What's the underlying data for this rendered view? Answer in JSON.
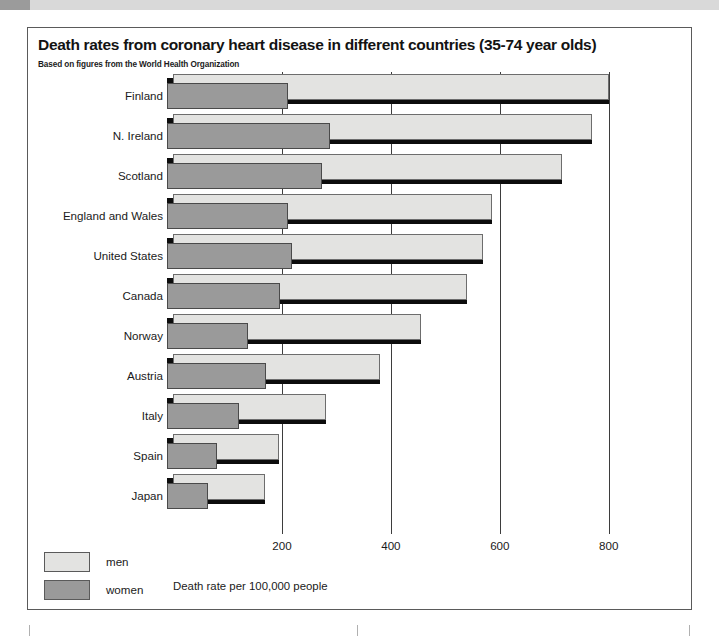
{
  "figure": {
    "title": "Death rates from coronary heart disease in different countries (35-74 year olds)",
    "subtitle": "Based on figures from the World Health Organization"
  },
  "legend": {
    "items": [
      {
        "label": "men",
        "color": "#e3e3e1"
      },
      {
        "label": "women",
        "color": "#9a9a9a"
      }
    ]
  },
  "chart_data": {
    "type": "bar",
    "orientation": "horizontal",
    "title": "Death rates from coronary heart disease in different countries (35-74 year olds)",
    "subtitle": "Based on figures from the World Health Organization",
    "xlabel": "Death rate per 100,000 people",
    "ylabel": "",
    "xlim": [
      0,
      850
    ],
    "xticks": [
      200,
      400,
      600,
      800
    ],
    "xtick_labels": [
      "200",
      "400",
      "600",
      "800"
    ],
    "grid": "vertical gridlines at x ticks",
    "legend_position": "bottom-left",
    "categories": [
      "Finland",
      "N. Ireland",
      "Scotland",
      "England and Wales",
      "United States",
      "Canada",
      "Norway",
      "Austria",
      "Italy",
      "Spain",
      "Japan"
    ],
    "series": [
      {
        "name": "men",
        "color": "#e3e3e1",
        "values": [
          800,
          770,
          715,
          585,
          570,
          540,
          455,
          380,
          280,
          195,
          168
        ]
      },
      {
        "name": "women",
        "color": "#9a9a9a",
        "values": [
          222,
          300,
          285,
          222,
          230,
          208,
          148,
          182,
          132,
          92,
          75
        ]
      }
    ]
  }
}
